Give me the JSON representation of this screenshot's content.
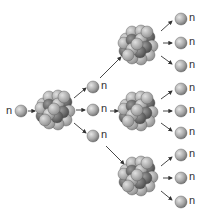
{
  "diagram": {
    "neutron_label": "n",
    "colors": {
      "neutron": "#a8a8a8",
      "nucleus_dark": "#6a6a6a",
      "nucleus_light": "#b9b9b9",
      "arrow": "#333333"
    },
    "initial_neutron": {
      "x": 21,
      "y": 111,
      "label_x": 6,
      "label_y": 105
    },
    "nuclei": [
      {
        "id": "gen0",
        "x": 55,
        "y": 110
      },
      {
        "id": "gen1-top",
        "x": 138,
        "y": 45
      },
      {
        "id": "gen1-mid",
        "x": 138,
        "y": 111
      },
      {
        "id": "gen1-bot",
        "x": 138,
        "y": 176
      }
    ],
    "neutrons": [
      {
        "x": 93,
        "y": 87
      },
      {
        "x": 93,
        "y": 110
      },
      {
        "x": 93,
        "y": 136
      },
      {
        "x": 181,
        "y": 19
      },
      {
        "x": 181,
        "y": 43
      },
      {
        "x": 181,
        "y": 66
      },
      {
        "x": 181,
        "y": 89
      },
      {
        "x": 181,
        "y": 111
      },
      {
        "x": 181,
        "y": 133
      },
      {
        "x": 181,
        "y": 155
      },
      {
        "x": 181,
        "y": 178
      },
      {
        "x": 181,
        "y": 202
      }
    ]
  }
}
